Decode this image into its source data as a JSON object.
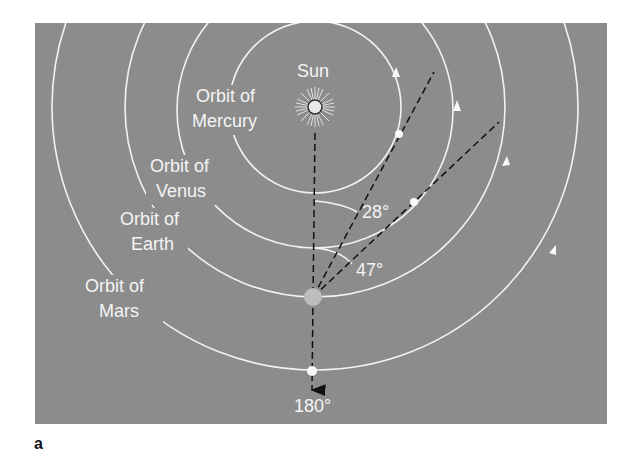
{
  "figure": {
    "panel_label": "a",
    "colors": {
      "background": "#ffffff",
      "panel": "#8c8c8c",
      "orbit": "#f2f2f2",
      "sightline": "#111111",
      "earth": "#bdbdbd",
      "sun": "#e8e8e8"
    },
    "sun": {
      "label": "Sun"
    },
    "orbits": [
      {
        "name": "Mercury",
        "label_line1": "Orbit of",
        "label_line2": "Mercury"
      },
      {
        "name": "Venus",
        "label_line1": "Orbit of",
        "label_line2": "Venus"
      },
      {
        "name": "Earth",
        "label_line1": "Orbit of",
        "label_line2": "Earth"
      },
      {
        "name": "Mars",
        "label_line1": "Orbit of",
        "label_line2": "Mars"
      }
    ],
    "angles": [
      {
        "planet": "Mercury",
        "label": "28°"
      },
      {
        "planet": "Venus",
        "label": "47°"
      },
      {
        "planet": "Mars",
        "label": "180°"
      }
    ]
  }
}
